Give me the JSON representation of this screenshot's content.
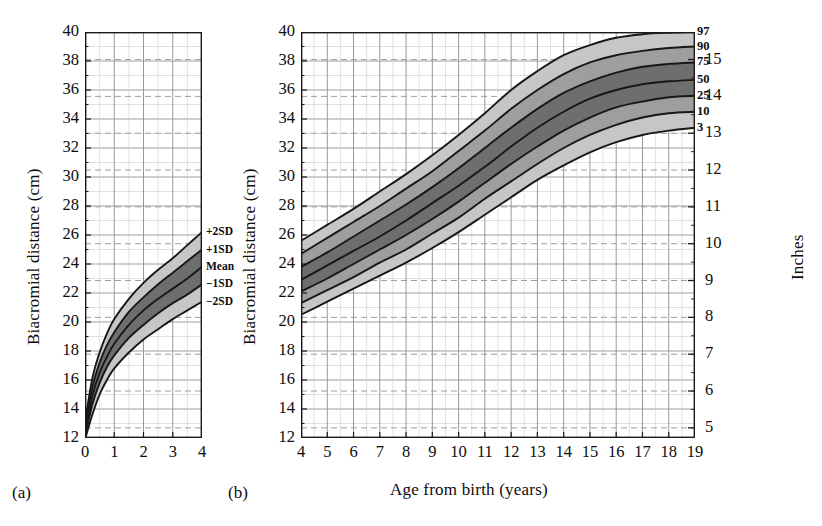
{
  "figure": {
    "panels": [
      {
        "key": "a",
        "label": "(a)",
        "xlabel": "",
        "ylabel": "Biacromial distance (cm)",
        "xticks": [
          "0",
          "1",
          "2",
          "3",
          "4"
        ],
        "yticks": [
          "12",
          "14",
          "16",
          "18",
          "20",
          "22",
          "24",
          "26",
          "28",
          "30",
          "32",
          "34",
          "36",
          "38",
          "40"
        ],
        "series_labels": [
          "+2SD",
          "+1SD",
          "Mean",
          "−1SD",
          "−2SD"
        ]
      },
      {
        "key": "b",
        "label": "(b)",
        "xlabel": "Age from birth (years)",
        "ylabel": "Biacromial distance (cm)",
        "ylabel_right": "Inches",
        "xticks": [
          "4",
          "5",
          "6",
          "7",
          "8",
          "9",
          "10",
          "11",
          "12",
          "13",
          "14",
          "15",
          "16",
          "17",
          "18",
          "19"
        ],
        "yticks": [
          "12",
          "14",
          "16",
          "18",
          "20",
          "22",
          "24",
          "26",
          "28",
          "30",
          "32",
          "34",
          "36",
          "38",
          "40"
        ],
        "yticks_right": [
          "5",
          "6",
          "7",
          "8",
          "9",
          "10",
          "11",
          "12",
          "13",
          "14",
          "15"
        ],
        "series_labels": [
          "97",
          "90",
          "75",
          "50",
          "25",
          "10",
          "3"
        ]
      }
    ]
  },
  "colors": {
    "axis": "#1a1a1a",
    "grid_major": "#8d8d8d",
    "grid_minor": "#c9c9c9",
    "grid_inch": "#9a9a9a",
    "band_outer": "#c6c6c6",
    "band_mid": "#9e9e9e",
    "band_inner": "#6e6e6e",
    "curve": "#171717",
    "text": "#0d0d0d"
  },
  "chart_data": [
    {
      "type": "line",
      "id": "panel-a",
      "title": "",
      "xlabel": "",
      "ylabel": "Biacromial distance (cm)",
      "xlim": [
        0,
        4
      ],
      "ylim": [
        12,
        40
      ],
      "xticks": [
        0,
        1,
        2,
        3,
        4
      ],
      "yticks": [
        12,
        14,
        16,
        18,
        20,
        22,
        24,
        26,
        28,
        30,
        32,
        34,
        36,
        38,
        40
      ],
      "grid": true,
      "legend": "inline-right",
      "x": [
        0,
        0.25,
        0.5,
        0.75,
        1,
        1.5,
        2,
        2.5,
        3,
        3.5,
        4
      ],
      "series": [
        {
          "name": "+2SD",
          "values": [
            13.1,
            16.1,
            17.9,
            19.2,
            20.2,
            21.6,
            22.7,
            23.6,
            24.4,
            25.3,
            26.2
          ]
        },
        {
          "name": "+1SD",
          "values": [
            12.8,
            15.5,
            17.2,
            18.4,
            19.3,
            20.7,
            21.7,
            22.6,
            23.4,
            24.2,
            25.0
          ]
        },
        {
          "name": "Mean",
          "values": [
            12.4,
            14.9,
            16.5,
            17.6,
            18.5,
            19.8,
            20.8,
            21.6,
            22.3,
            23.0,
            23.8
          ]
        },
        {
          "name": "−1SD",
          "values": [
            12.1,
            14.3,
            15.8,
            16.9,
            17.7,
            18.9,
            19.8,
            20.6,
            21.3,
            21.9,
            22.6
          ]
        },
        {
          "name": "−2SD",
          "values": [
            11.9,
            13.6,
            15.0,
            16.0,
            16.8,
            17.9,
            18.8,
            19.5,
            20.2,
            20.8,
            21.4
          ]
        }
      ]
    },
    {
      "type": "line",
      "id": "panel-b",
      "title": "",
      "xlabel": "Age from birth (years)",
      "ylabel": "Biacromial distance (cm)",
      "ylabel_right": "Inches",
      "xlim": [
        4,
        19
      ],
      "ylim": [
        12,
        40
      ],
      "ylim_right": [
        5,
        15
      ],
      "xticks": [
        4,
        5,
        6,
        7,
        8,
        9,
        10,
        11,
        12,
        13,
        14,
        15,
        16,
        17,
        18,
        19
      ],
      "yticks": [
        12,
        14,
        16,
        18,
        20,
        22,
        24,
        26,
        28,
        30,
        32,
        34,
        36,
        38,
        40
      ],
      "yticks_right": [
        5,
        6,
        7,
        8,
        9,
        10,
        11,
        12,
        13,
        14,
        15
      ],
      "grid": true,
      "legend": "right-edge-percentiles",
      "x": [
        4,
        5,
        6,
        7,
        8,
        9,
        10,
        11,
        12,
        13,
        14,
        15,
        16,
        17,
        18,
        19
      ],
      "series": [
        {
          "name": "97",
          "values": [
            25.6,
            26.7,
            27.8,
            29.0,
            30.2,
            31.5,
            32.9,
            34.4,
            36.0,
            37.3,
            38.4,
            39.1,
            39.6,
            39.85,
            39.95,
            40.0
          ]
        },
        {
          "name": "90",
          "values": [
            24.7,
            25.8,
            26.9,
            28.0,
            29.2,
            30.4,
            31.8,
            33.2,
            34.7,
            36.0,
            37.1,
            37.9,
            38.4,
            38.7,
            38.9,
            39.0
          ]
        },
        {
          "name": "75",
          "values": [
            23.8,
            24.8,
            25.9,
            27.0,
            28.1,
            29.3,
            30.6,
            32.0,
            33.4,
            34.7,
            35.8,
            36.6,
            37.2,
            37.6,
            37.8,
            37.9
          ]
        },
        {
          "name": "50",
          "values": [
            22.9,
            23.9,
            24.9,
            25.9,
            27.0,
            28.2,
            29.4,
            30.7,
            32.1,
            33.4,
            34.5,
            35.4,
            36.0,
            36.4,
            36.6,
            36.7
          ]
        },
        {
          "name": "25",
          "values": [
            22.1,
            23.0,
            24.0,
            25.0,
            26.0,
            27.1,
            28.3,
            29.6,
            30.9,
            32.1,
            33.2,
            34.1,
            34.8,
            35.2,
            35.5,
            35.6
          ]
        },
        {
          "name": "10",
          "values": [
            21.3,
            22.2,
            23.1,
            24.1,
            25.0,
            26.1,
            27.2,
            28.5,
            29.7,
            30.9,
            32.0,
            32.9,
            33.6,
            34.1,
            34.4,
            34.5
          ]
        },
        {
          "name": "3",
          "values": [
            20.5,
            21.4,
            22.3,
            23.2,
            24.1,
            25.1,
            26.2,
            27.4,
            28.6,
            29.8,
            30.8,
            31.7,
            32.4,
            32.9,
            33.2,
            33.4
          ]
        }
      ],
      "bands": [
        {
          "upper": "97",
          "lower": "90",
          "shade": "outer"
        },
        {
          "upper": "90",
          "lower": "75",
          "shade": "mid"
        },
        {
          "upper": "75",
          "lower": "50",
          "shade": "inner"
        },
        {
          "upper": "50",
          "lower": "25",
          "shade": "inner"
        },
        {
          "upper": "25",
          "lower": "10",
          "shade": "mid"
        },
        {
          "upper": "10",
          "lower": "3",
          "shade": "outer"
        }
      ]
    }
  ]
}
